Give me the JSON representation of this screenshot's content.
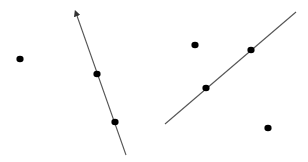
{
  "canvas": {
    "width": 308,
    "height": 162,
    "background": "#ffffff"
  },
  "colors": {
    "line": "#555555",
    "point": "#000000"
  },
  "figures": [
    {
      "name": "left-figure",
      "line": {
        "x1": 76,
        "y1": 13,
        "x2": 126,
        "y2": 155,
        "arrow_at_start": true
      },
      "points_on_line": [
        {
          "x": 97,
          "y": 74
        },
        {
          "x": 115,
          "y": 122
        }
      ],
      "points_off_line": [
        {
          "x": 20,
          "y": 59
        }
      ]
    },
    {
      "name": "right-figure",
      "line": {
        "x1": 165,
        "y1": 124,
        "x2": 296,
        "y2": 12,
        "arrow_at_start": false
      },
      "points_on_line": [
        {
          "x": 206,
          "y": 88
        },
        {
          "x": 251,
          "y": 50
        }
      ],
      "points_off_line": [
        {
          "x": 195,
          "y": 45
        },
        {
          "x": 268,
          "y": 128
        }
      ]
    }
  ]
}
